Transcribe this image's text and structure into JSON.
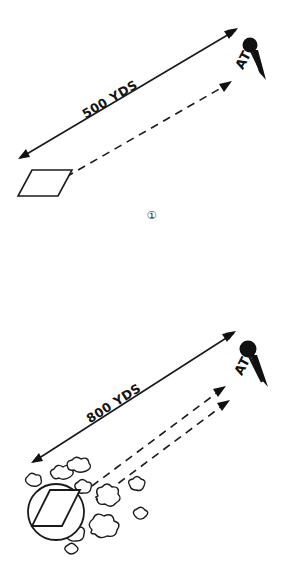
{
  "document": {
    "title": "Tank engagement range diagrams",
    "background_color": "#ffffff",
    "ink_color": "#1a1a1a"
  },
  "figures": [
    {
      "caption": "①",
      "range_label": "500 YDS",
      "target_label": "AT",
      "target_symbol": "pin-icon",
      "vehicle_symbol": "parallelogram-tank-icon",
      "solid_arrow": "double-headed-range-arrow",
      "dashed_arrows": 1,
      "concealment": "none"
    },
    {
      "caption": "②",
      "range_label": "800 YDS",
      "target_label": "AT",
      "target_symbol": "pin-icon",
      "vehicle_symbol": "circled-parallelogram-tank-icon",
      "solid_arrow": "double-headed-range-arrow",
      "dashed_arrows": 2,
      "concealment": "bushes"
    }
  ]
}
